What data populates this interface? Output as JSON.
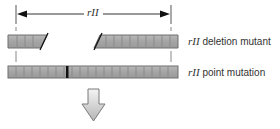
{
  "diagram": {
    "span_label": "rII",
    "rows": [
      {
        "gene": "rII",
        "description": "deletion mutant"
      },
      {
        "gene": "rII",
        "description": "point mutation"
      }
    ],
    "colors": {
      "bar_fill": "#a8a8a8",
      "bar_border": "#6e6e6e",
      "segment_divider": "#8a8a8a",
      "mutation_mark": "#111111",
      "line": "#333333",
      "arrow_fill_top": "#f2f2f2",
      "arrow_fill_bottom": "#b8b8b8"
    }
  }
}
